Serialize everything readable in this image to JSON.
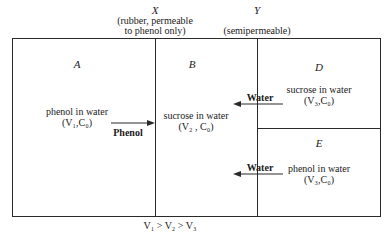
{
  "membranes": {
    "x": {
      "letter": "X",
      "desc_line1": "(rubber, permeable",
      "desc_line2": "to phenol only)"
    },
    "y": {
      "letter": "Y",
      "desc": "(semipermeable)"
    }
  },
  "compartments": {
    "a": {
      "letter": "A",
      "contents": "phenol in water",
      "params": "(V₁,C₀)"
    },
    "b": {
      "letter": "B",
      "contents": "sucrose in water",
      "params": "(V₂ , C₀)"
    },
    "d": {
      "letter": "D",
      "contents": "sucrose in water",
      "params": "(V₃,C₀)"
    },
    "e": {
      "letter": "E",
      "contents": "phenol in water",
      "params": "(V₃,C₀)"
    }
  },
  "flows": [
    {
      "label": "Phenol",
      "direction": "right",
      "from": "A",
      "to": "B"
    },
    {
      "label": "Water",
      "direction": "left",
      "from": "D",
      "to": "B"
    },
    {
      "label": "Water",
      "direction": "left",
      "from": "E",
      "to": "B"
    }
  ],
  "footer": {
    "relation": "V₁ > V₂ > V₃"
  },
  "colors": {
    "line": "#2a2a2a",
    "background": "#ffffff"
  }
}
